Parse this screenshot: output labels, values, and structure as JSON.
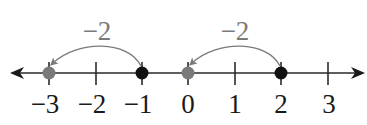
{
  "diagram": {
    "type": "number-line",
    "axis": {
      "y": 73,
      "x_start": 10,
      "x_end": 364,
      "color": "#2a2a2a",
      "ticks": [
        {
          "value": -3,
          "x": 49,
          "label": "−3"
        },
        {
          "value": -2,
          "x": 96,
          "label": "−2"
        },
        {
          "value": -1,
          "x": 142,
          "label": "−1"
        },
        {
          "value": 0,
          "x": 188,
          "label": "0"
        },
        {
          "value": 1,
          "x": 235,
          "label": "1"
        },
        {
          "value": 2,
          "x": 281,
          "label": "2"
        },
        {
          "value": 3,
          "x": 328,
          "label": "3"
        }
      ]
    },
    "points": [
      {
        "value": -3,
        "x": 49,
        "fill": "#7a7a7a",
        "role": "end"
      },
      {
        "value": -1,
        "x": 142,
        "fill": "#111111",
        "role": "start"
      },
      {
        "value": 0,
        "x": 188,
        "fill": "#7a7a7a",
        "role": "end"
      },
      {
        "value": 2,
        "x": 281,
        "fill": "#111111",
        "role": "start"
      }
    ],
    "jumps": [
      {
        "from": -1,
        "to": -3,
        "label": "−2",
        "color": "#7a7a7a"
      },
      {
        "from": 2,
        "to": 0,
        "label": "−2",
        "color": "#7a7a7a"
      }
    ]
  }
}
